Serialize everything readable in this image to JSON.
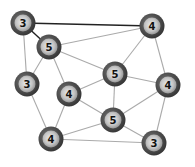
{
  "graph": {
    "nodes": [
      {
        "id": "A",
        "label": "3",
        "x": 23,
        "y": 23
      },
      {
        "id": "B",
        "label": "4",
        "x": 152,
        "y": 26
      },
      {
        "id": "C",
        "label": "5",
        "x": 49,
        "y": 47
      },
      {
        "id": "D",
        "label": "3",
        "x": 27,
        "y": 84
      },
      {
        "id": "E",
        "label": "5",
        "x": 115,
        "y": 74
      },
      {
        "id": "F",
        "label": "4",
        "x": 168,
        "y": 85
      },
      {
        "id": "G",
        "label": "4",
        "x": 69,
        "y": 94
      },
      {
        "id": "H",
        "label": "5",
        "x": 113,
        "y": 120
      },
      {
        "id": "I",
        "label": "4",
        "x": 51,
        "y": 139
      },
      {
        "id": "J",
        "label": "3",
        "x": 154,
        "y": 143
      }
    ],
    "edges": [
      {
        "from": "A",
        "to": "B",
        "style": "dark"
      },
      {
        "from": "A",
        "to": "C",
        "style": "dark"
      },
      {
        "from": "A",
        "to": "D",
        "style": "light"
      },
      {
        "from": "C",
        "to": "B",
        "style": "light"
      },
      {
        "from": "C",
        "to": "D",
        "style": "light"
      },
      {
        "from": "C",
        "to": "E",
        "style": "light"
      },
      {
        "from": "C",
        "to": "G",
        "style": "light"
      },
      {
        "from": "B",
        "to": "E",
        "style": "light"
      },
      {
        "from": "B",
        "to": "F",
        "style": "light"
      },
      {
        "from": "E",
        "to": "G",
        "style": "light"
      },
      {
        "from": "E",
        "to": "F",
        "style": "light"
      },
      {
        "from": "E",
        "to": "H",
        "style": "light"
      },
      {
        "from": "D",
        "to": "I",
        "style": "light"
      },
      {
        "from": "G",
        "to": "I",
        "style": "light"
      },
      {
        "from": "G",
        "to": "H",
        "style": "light"
      },
      {
        "from": "F",
        "to": "H",
        "style": "light"
      },
      {
        "from": "F",
        "to": "J",
        "style": "light"
      },
      {
        "from": "H",
        "to": "I",
        "style": "light"
      },
      {
        "from": "H",
        "to": "J",
        "style": "light"
      },
      {
        "from": "I",
        "to": "J",
        "style": "light"
      }
    ],
    "colors": {
      "edge_dark": "#222222",
      "edge_light": "#aaaaaa",
      "node_ring": "#4a4a4a",
      "node_inner": "#c8c8c8",
      "node_center": "#e6e6e6",
      "label": "#111111"
    }
  }
}
